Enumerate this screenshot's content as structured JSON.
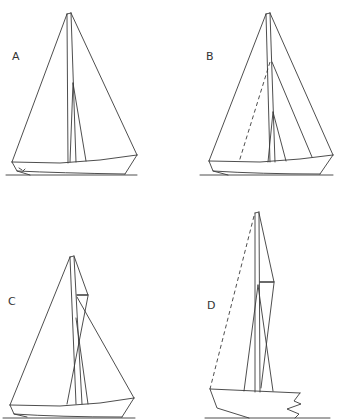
{
  "figure": {
    "panels": [
      {
        "id": "A",
        "label": "A",
        "description": "Sloop with masthead jib and mainsail, single mast, both sails full height",
        "x": 12,
        "y": 53
      },
      {
        "id": "B",
        "label": "B",
        "description": "Sloop with masthead mainsail, fractional forestay (dashed) and inner jib",
        "x": 205,
        "y": 52
      },
      {
        "id": "C",
        "label": "C",
        "description": "Gaff-rigged cutter with headsail and gaff mainsail",
        "x": 8,
        "y": 298
      },
      {
        "id": "D",
        "label": "D",
        "description": "Gaff-rigged boat with dashed topmast stay, broken hull (stern cut)",
        "x": 207,
        "y": 301
      }
    ],
    "line_color": "#3a3a3a",
    "background": "#ffffff"
  }
}
